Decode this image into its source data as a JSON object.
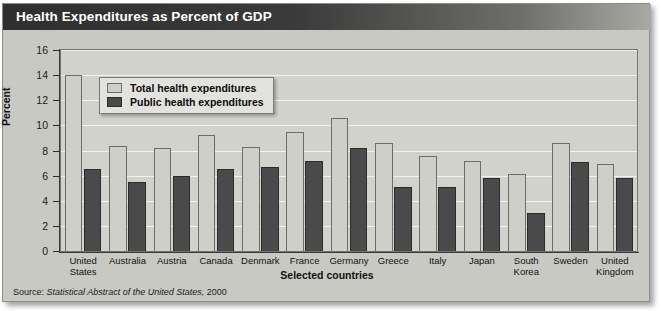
{
  "title": "Health Expenditures as Percent of GDP",
  "source": {
    "label": "Source:",
    "italic_part": "Statistical Abstract of the United States,",
    "year": "2000"
  },
  "legend": {
    "position": "inside-top-left",
    "entries": [
      {
        "label": "Total health expenditures",
        "color": "#cfcfca"
      },
      {
        "label": "Public health expenditures",
        "color": "#4a4a4a"
      }
    ]
  },
  "colors": {
    "title_bar": "#2f2f2f",
    "title_text": "#ffffff",
    "plot_background": "#d2d2cd",
    "card_background": "#c9c9c4",
    "gridline": "#f2f2ee",
    "total_bar": "#cfcfca",
    "public_bar": "#4a4a4a"
  },
  "chart_data": {
    "type": "bar",
    "title": "Health Expenditures as Percent of GDP",
    "xlabel": "Selected countries",
    "ylabel": "Percent",
    "ylim": [
      0,
      16
    ],
    "yticks": [
      0,
      2,
      4,
      6,
      8,
      10,
      12,
      14,
      16
    ],
    "ytick_labels": [
      "0",
      "2",
      "4",
      "6",
      "8",
      "10",
      "12",
      "14",
      "16"
    ],
    "grid": true,
    "legend_position": "upper left inside plot",
    "categories": [
      "United States",
      "Australia",
      "Austria",
      "Canada",
      "Denmark",
      "France",
      "Germany",
      "Greece",
      "Italy",
      "Japan",
      "South Korea",
      "Sweden",
      "United Kingdom"
    ],
    "category_lines": [
      [
        "United",
        "States"
      ],
      [
        "Australia"
      ],
      [
        "Austria"
      ],
      [
        "Canada"
      ],
      [
        "Denmark"
      ],
      [
        "France"
      ],
      [
        "Germany"
      ],
      [
        "Greece"
      ],
      [
        "Italy"
      ],
      [
        "Japan"
      ],
      [
        "South",
        "Korea"
      ],
      [
        "Sweden"
      ],
      [
        "United",
        "Kingdom"
      ]
    ],
    "series": [
      {
        "name": "Total health expenditures",
        "color": "#cfcfca",
        "values": [
          14.0,
          8.4,
          8.2,
          9.2,
          8.3,
          9.5,
          10.6,
          8.6,
          7.6,
          7.2,
          6.1,
          8.6,
          6.9
        ]
      },
      {
        "name": "Public health expenditures",
        "color": "#4a4a4a",
        "values": [
          6.5,
          5.5,
          6.0,
          6.5,
          6.7,
          7.2,
          8.2,
          5.1,
          5.1,
          5.8,
          3.0,
          7.1,
          5.8
        ]
      }
    ]
  }
}
